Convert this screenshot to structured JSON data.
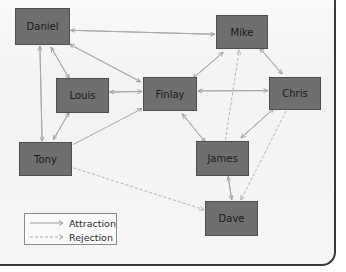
{
  "diagram": {
    "type": "sociogram",
    "colors": {
      "node_fill": "#6f6f6f",
      "attraction": "#a8a8a8",
      "rejection": "#b4b4b4"
    },
    "nodes": [
      {
        "id": "daniel",
        "label": "Daniel"
      },
      {
        "id": "mike",
        "label": "Mike"
      },
      {
        "id": "louis",
        "label": "Louis"
      },
      {
        "id": "finlay",
        "label": "Finlay"
      },
      {
        "id": "chris",
        "label": "Chris"
      },
      {
        "id": "tony",
        "label": "Tony"
      },
      {
        "id": "james",
        "label": "James"
      },
      {
        "id": "dave",
        "label": "Dave"
      }
    ],
    "edges": [
      {
        "from": "daniel",
        "to": "mike",
        "kind": "attraction"
      },
      {
        "from": "mike",
        "to": "daniel",
        "kind": "attraction"
      },
      {
        "from": "daniel",
        "to": "louis",
        "kind": "attraction"
      },
      {
        "from": "louis",
        "to": "daniel",
        "kind": "attraction"
      },
      {
        "from": "daniel",
        "to": "finlay",
        "kind": "attraction"
      },
      {
        "from": "finlay",
        "to": "daniel",
        "kind": "attraction"
      },
      {
        "from": "daniel",
        "to": "tony",
        "kind": "attraction"
      },
      {
        "from": "tony",
        "to": "daniel",
        "kind": "attraction"
      },
      {
        "from": "louis",
        "to": "finlay",
        "kind": "attraction"
      },
      {
        "from": "finlay",
        "to": "louis",
        "kind": "attraction"
      },
      {
        "from": "louis",
        "to": "tony",
        "kind": "attraction"
      },
      {
        "from": "tony",
        "to": "louis",
        "kind": "attraction"
      },
      {
        "from": "tony",
        "to": "finlay",
        "kind": "attraction"
      },
      {
        "from": "finlay",
        "to": "mike",
        "kind": "attraction"
      },
      {
        "from": "mike",
        "to": "finlay",
        "kind": "attraction"
      },
      {
        "from": "finlay",
        "to": "chris",
        "kind": "attraction"
      },
      {
        "from": "chris",
        "to": "finlay",
        "kind": "attraction"
      },
      {
        "from": "finlay",
        "to": "james",
        "kind": "attraction"
      },
      {
        "from": "james",
        "to": "finlay",
        "kind": "attraction"
      },
      {
        "from": "mike",
        "to": "chris",
        "kind": "attraction"
      },
      {
        "from": "chris",
        "to": "mike",
        "kind": "attraction"
      },
      {
        "from": "chris",
        "to": "james",
        "kind": "attraction"
      },
      {
        "from": "james",
        "to": "chris",
        "kind": "attraction"
      },
      {
        "from": "james",
        "to": "dave",
        "kind": "attraction"
      },
      {
        "from": "dave",
        "to": "james",
        "kind": "attraction"
      },
      {
        "from": "tony",
        "to": "dave",
        "kind": "rejection"
      },
      {
        "from": "james",
        "to": "mike",
        "kind": "rejection"
      },
      {
        "from": "chris",
        "to": "dave",
        "kind": "rejection"
      }
    ]
  },
  "legend": {
    "attraction_label": "Attraction",
    "rejection_label": "Rejection"
  }
}
